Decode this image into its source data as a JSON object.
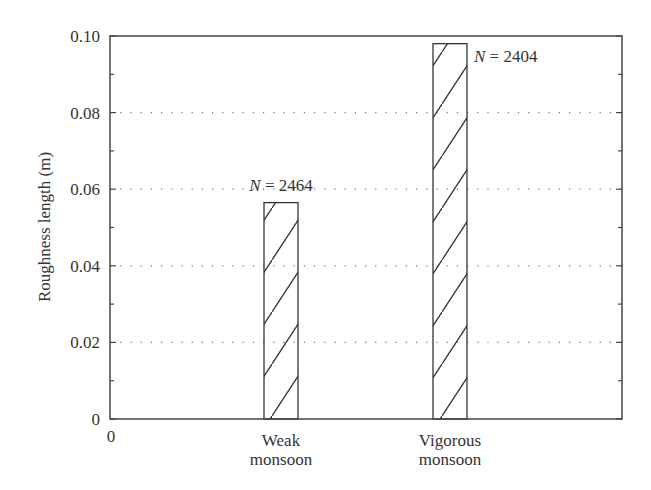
{
  "chart_data": {
    "type": "bar",
    "title": "",
    "xlabel": "",
    "ylabel": "Roughness length (m)",
    "ylim": [
      0,
      0.1
    ],
    "yticks": [
      "0",
      "0.02",
      "0.04",
      "0.06",
      "0.08",
      "0.10"
    ],
    "ytick_values": [
      0,
      0.02,
      0.04,
      0.06,
      0.08,
      0.1
    ],
    "x_origin_label": "0",
    "categories": [
      [
        "Weak",
        "monsoon"
      ],
      [
        "Vigorous",
        "monsoon"
      ]
    ],
    "values": [
      0.0565,
      0.098
    ],
    "annotations": [
      {
        "italic": "N",
        "text": " = 2464"
      },
      {
        "italic": "N",
        "text": " = 2404"
      }
    ],
    "bar_fill": "hatched (diagonal lines)",
    "grid": "horizontal dotted at major ticks",
    "legend": "none",
    "colors": {
      "axis": "#444444",
      "bar_stroke": "#333333",
      "grid": "#777777"
    }
  }
}
